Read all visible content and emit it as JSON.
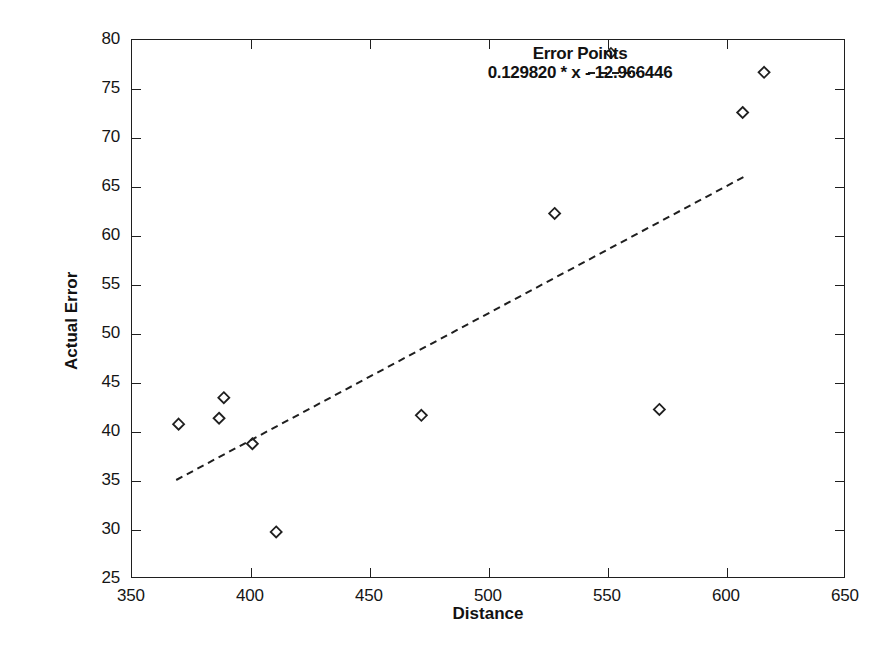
{
  "chart_data": {
    "type": "scatter",
    "title": "",
    "xlabel": "Distance",
    "ylabel": "Actual Error",
    "xlim": [
      350,
      650
    ],
    "ylim": [
      25,
      80
    ],
    "xticks": [
      350,
      400,
      450,
      500,
      550,
      600,
      650
    ],
    "yticks": [
      25,
      30,
      35,
      40,
      45,
      50,
      55,
      60,
      65,
      70,
      75,
      80
    ],
    "grid": false,
    "legend_position": "top-center-inside",
    "series": [
      {
        "name": "Error Points",
        "type": "scatter",
        "marker": "diamond",
        "color": "#1f1f1f",
        "points": [
          {
            "x": 370,
            "y": 40.7
          },
          {
            "x": 387,
            "y": 41.3
          },
          {
            "x": 389,
            "y": 43.4
          },
          {
            "x": 401,
            "y": 38.7
          },
          {
            "x": 411,
            "y": 29.7
          },
          {
            "x": 472,
            "y": 41.6
          },
          {
            "x": 528,
            "y": 62.2
          },
          {
            "x": 572,
            "y": 42.2
          },
          {
            "x": 607,
            "y": 72.5
          },
          {
            "x": 616,
            "y": 76.6
          }
        ]
      },
      {
        "name": "0.129820 * x - 12.966446",
        "type": "line",
        "style": "dashed",
        "color": "#1f1f1f",
        "slope": 0.12982,
        "intercept": -12.966446,
        "x_start": 369,
        "x_end": 608,
        "y_start": 35.0,
        "y_end": 66.0
      }
    ]
  },
  "legend": {
    "entry_points_label": "Error Points",
    "entry_fit_label": "0.129820 * x - 12.966446",
    "point_marker": "diamond-marker",
    "line_marker": "dashed-line-sample"
  },
  "axes": {
    "x_title": "Distance",
    "y_title": "Actual Error",
    "x_tick_labels": [
      "350",
      "400",
      "450",
      "500",
      "550",
      "600",
      "650"
    ],
    "y_tick_labels": [
      "25",
      "30",
      "35",
      "40",
      "45",
      "50",
      "55",
      "60",
      "65",
      "70",
      "75",
      "80"
    ]
  }
}
